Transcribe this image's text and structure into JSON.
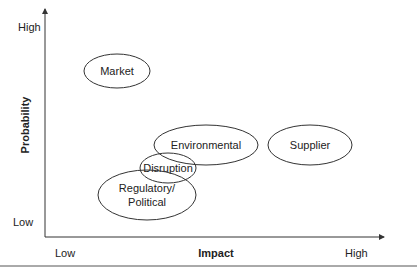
{
  "diagram": {
    "type": "risk-matrix",
    "y_axis": {
      "title": "Probability",
      "high_label": "High",
      "low_label": "Low"
    },
    "x_axis": {
      "title": "Impact",
      "low_label": "Low",
      "high_label": "High"
    },
    "risks": [
      {
        "id": "market",
        "label_lines": [
          "Market"
        ]
      },
      {
        "id": "environmental",
        "label_lines": [
          "Environmental"
        ]
      },
      {
        "id": "supplier",
        "label_lines": [
          "Supplier"
        ]
      },
      {
        "id": "disruption",
        "label_lines": [
          "Disruption"
        ]
      },
      {
        "id": "regulatory",
        "label_lines": [
          "Regulatory/",
          "Political"
        ]
      }
    ],
    "colors": {
      "stroke": "#333333",
      "text": "#222222",
      "background": "#ffffff"
    }
  }
}
